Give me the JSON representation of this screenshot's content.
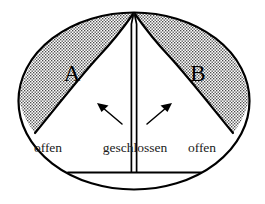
{
  "figure": {
    "background_color": "#ffffff",
    "stroke_color": "#000000",
    "stipple_color": "#4d4d4d",
    "width": 265,
    "height": 204
  },
  "regions": [
    {
      "id": "A",
      "label": "A",
      "side": "left",
      "fill": "stipple",
      "cx": 72,
      "cy": 72
    },
    {
      "id": "B",
      "label": "B",
      "side": "right",
      "fill": "stipple",
      "cx": 198,
      "cy": 72
    }
  ],
  "annotations": {
    "left_open": {
      "text": "offen",
      "x": 48,
      "y": 152
    },
    "center_shut": {
      "text": "geschlossen",
      "x": 135,
      "y": 152
    },
    "right_open": {
      "text": "offen",
      "x": 202,
      "y": 152
    }
  },
  "arrows": [
    {
      "id": "left-arrow",
      "from_x": 121,
      "from_y": 123,
      "to_x": 99,
      "to_y": 105,
      "points_to": "left-curve"
    },
    {
      "id": "right-arrow",
      "from_x": 148,
      "from_y": 123,
      "to_x": 170,
      "to_y": 105,
      "points_to": "right-curve"
    }
  ],
  "geometry": {
    "ellipse": {
      "cx": 134,
      "cy": 101,
      "rx": 116,
      "ry": 89
    },
    "channel": {
      "top_x": 134,
      "top_y": 13,
      "bottom_y": 172,
      "half_width": 2.6
    },
    "base_bar": {
      "x1": 68,
      "x2": 201,
      "y": 172
    }
  }
}
